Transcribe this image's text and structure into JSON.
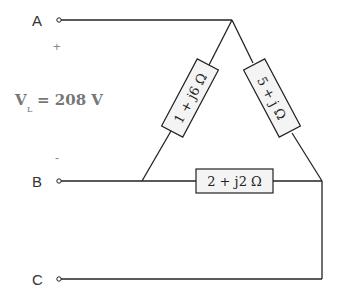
{
  "diagram": {
    "type": "delta-connected three-phase load",
    "terminals": [
      {
        "label": "A"
      },
      {
        "label": "B"
      },
      {
        "label": "C"
      }
    ],
    "polarity": {
      "plus": "+",
      "minus": "-"
    },
    "line_voltage": {
      "symbol": "V",
      "subscript": "L",
      "value": "= 208 V"
    },
    "impedances": [
      {
        "id": "ab",
        "label": "1 + j6 Ω"
      },
      {
        "id": "ac",
        "label": "5 + j Ω"
      },
      {
        "id": "bc",
        "label": "2 + j2 Ω"
      }
    ],
    "colors": {
      "line": "#222222",
      "text": "#333333",
      "voltage_text": "#777777",
      "box_fill": "#f4f4f4"
    }
  }
}
